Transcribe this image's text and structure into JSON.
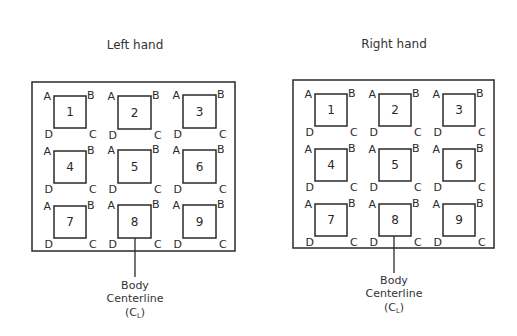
{
  "panels": [
    {
      "title": "Left hand",
      "frame": {
        "x": 32,
        "y": 82,
        "w": 203,
        "h": 169
      },
      "title_pos": {
        "x": 135,
        "y": 49
      },
      "boxes": [
        {
          "label": "1",
          "x": 54,
          "y": 96,
          "s": 32
        },
        {
          "label": "2",
          "x": 118,
          "y": 96,
          "s": 33
        },
        {
          "label": "3",
          "x": 183,
          "y": 95,
          "s": 33
        },
        {
          "label": "4",
          "x": 54,
          "y": 151,
          "s": 32
        },
        {
          "label": "5",
          "x": 118,
          "y": 150,
          "s": 33
        },
        {
          "label": "6",
          "x": 183,
          "y": 150,
          "s": 33
        },
        {
          "label": "7",
          "x": 54,
          "y": 206,
          "s": 32
        },
        {
          "label": "8",
          "x": 118,
          "y": 205,
          "s": 33
        },
        {
          "label": "9",
          "x": 183,
          "y": 205,
          "s": 33
        }
      ],
      "centerline": {
        "x": 135,
        "y1": 238,
        "y2": 277
      },
      "note_y": [
        289,
        302,
        316
      ]
    },
    {
      "title": "Right hand",
      "frame": {
        "x": 293,
        "y": 80,
        "w": 201,
        "h": 168
      },
      "title_pos": {
        "x": 394,
        "y": 48
      },
      "boxes": [
        {
          "label": "1",
          "x": 315,
          "y": 94,
          "s": 32
        },
        {
          "label": "2",
          "x": 379,
          "y": 94,
          "s": 32
        },
        {
          "label": "3",
          "x": 443,
          "y": 94,
          "s": 32
        },
        {
          "label": "4",
          "x": 315,
          "y": 149,
          "s": 32
        },
        {
          "label": "5",
          "x": 379,
          "y": 149,
          "s": 32
        },
        {
          "label": "6",
          "x": 443,
          "y": 149,
          "s": 32
        },
        {
          "label": "7",
          "x": 315,
          "y": 204,
          "s": 32
        },
        {
          "label": "8",
          "x": 379,
          "y": 204,
          "s": 32
        },
        {
          "label": "9",
          "x": 443,
          "y": 204,
          "s": 32
        }
      ],
      "centerline": {
        "x": 394,
        "y1": 236,
        "y2": 273
      },
      "note_y": [
        284,
        297,
        311
      ]
    }
  ],
  "corner_labels": {
    "tl": "A",
    "tr": "B",
    "br": "C",
    "bl": "D"
  },
  "centerline_note": {
    "line1": "Body",
    "line2": "Centerline",
    "line3_open": "(C",
    "line3_sub": "L",
    "line3_close": ")"
  },
  "colors": {
    "ink": "#2a2a2a",
    "background": "#ffffff"
  }
}
